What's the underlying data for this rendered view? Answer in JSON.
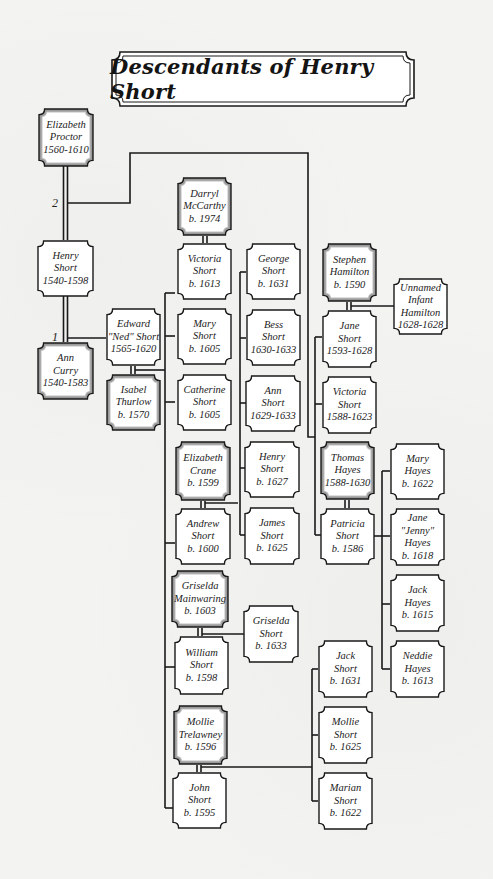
{
  "title": "Descendants of Henry Short",
  "marriage_labels": {
    "first": "1",
    "second": "2"
  },
  "colors": {
    "line": "#1a1a1a",
    "box_fill": "#ffffff",
    "spouse_bevel": "#9a9a9a",
    "background": "#f3f3f1"
  },
  "people": {
    "elizabeth_proctor": {
      "line1": "Elizabeth",
      "line2": "Proctor",
      "dates": "1560-1610",
      "style": "spouse"
    },
    "henry_short": {
      "line1": "Henry",
      "line2": "Short",
      "dates": "1540-1598",
      "style": "blood"
    },
    "ann_curry": {
      "line1": "Ann",
      "line2": "Curry",
      "dates": "1540-1583",
      "style": "spouse"
    },
    "edward_short": {
      "line1": "Edward",
      "line2": "\"Ned\" Short",
      "dates": "1565-1620",
      "style": "blood"
    },
    "isabel_thurlow": {
      "line1": "Isabel",
      "line2": "Thurlow",
      "dates": "b. 1570",
      "style": "spouse"
    },
    "darryl_mccarthy": {
      "line1": "Darryl",
      "line2": "McCarthy",
      "dates": "b. 1974",
      "style": "spouse"
    },
    "victoria_short_1613": {
      "line1": "Victoria",
      "line2": "Short",
      "dates": "b. 1613",
      "style": "blood"
    },
    "mary_short": {
      "line1": "Mary",
      "line2": "Short",
      "dates": "b. 1605",
      "style": "blood"
    },
    "catherine_short": {
      "line1": "Catherine",
      "line2": "Short",
      "dates": "b. 1605",
      "style": "blood"
    },
    "elizabeth_crane": {
      "line1": "Elizabeth",
      "line2": "Crane",
      "dates": "b. 1599",
      "style": "spouse"
    },
    "andrew_short": {
      "line1": "Andrew",
      "line2": "Short",
      "dates": "b. 1600",
      "style": "blood"
    },
    "griselda_mainwaring": {
      "line1": "Griselda",
      "line2": "Mainwaring",
      "dates": "b. 1603",
      "style": "spouse"
    },
    "william_short": {
      "line1": "William",
      "line2": "Short",
      "dates": "b. 1598",
      "style": "blood"
    },
    "mollie_trelawney": {
      "line1": "Mollie",
      "line2": "Trelawney",
      "dates": "b. 1596",
      "style": "spouse"
    },
    "john_short": {
      "line1": "John",
      "line2": "Short",
      "dates": "b. 1595",
      "style": "blood"
    },
    "george_short": {
      "line1": "George",
      "line2": "Short",
      "dates": "b. 1631",
      "style": "blood"
    },
    "bess_short": {
      "line1": "Bess",
      "line2": "Short",
      "dates": "1630-1633",
      "style": "blood"
    },
    "ann_short": {
      "line1": "Ann",
      "line2": "Short",
      "dates": "1629-1633",
      "style": "blood"
    },
    "henry_short_1627": {
      "line1": "Henry",
      "line2": "Short",
      "dates": "b. 1627",
      "style": "blood"
    },
    "james_short": {
      "line1": "James",
      "line2": "Short",
      "dates": "b. 1625",
      "style": "blood"
    },
    "griselda_short": {
      "line1": "Griselda",
      "line2": "Short",
      "dates": "b. 1633",
      "style": "blood"
    },
    "stephen_hamilton": {
      "line1": "Stephen",
      "line2": "Hamilton",
      "dates": "b. 1590",
      "style": "spouse"
    },
    "jane_short": {
      "line1": "Jane",
      "line2": "Short",
      "dates": "1593-1628",
      "style": "blood"
    },
    "victoria_short_1588": {
      "line1": "Victoria",
      "line2": "Short",
      "dates": "1588-1623",
      "style": "blood"
    },
    "thomas_hayes": {
      "line1": "Thomas",
      "line2": "Hayes",
      "dates": "1588-1630",
      "style": "spouse"
    },
    "patricia_short": {
      "line1": "Patricia",
      "line2": "Short",
      "dates": "b. 1586",
      "style": "blood"
    },
    "unnamed_infant": {
      "line1": "Unnamed",
      "line2": "Infant",
      "line3": "Hamilton",
      "dates": "1628-1628",
      "style": "blood"
    },
    "mary_hayes": {
      "line1": "Mary",
      "line2": "Hayes",
      "dates": "b. 1622",
      "style": "blood"
    },
    "jane_hayes": {
      "line1": "Jane",
      "line2": "\"Jenny\"",
      "line3": "Hayes",
      "dates": "b. 1618",
      "style": "blood"
    },
    "jack_hayes": {
      "line1": "Jack",
      "line2": "Hayes",
      "dates": "b. 1615",
      "style": "blood"
    },
    "neddie_hayes": {
      "line1": "Neddie",
      "line2": "Hayes",
      "dates": "b. 1613",
      "style": "blood"
    },
    "jack_short": {
      "line1": "Jack",
      "line2": "Short",
      "dates": "b. 1631",
      "style": "blood"
    },
    "mollie_short": {
      "line1": "Mollie",
      "line2": "Short",
      "dates": "b. 1625",
      "style": "blood"
    },
    "marian_short": {
      "line1": "Marian",
      "line2": "Short",
      "dates": "b. 1622",
      "style": "blood"
    }
  }
}
